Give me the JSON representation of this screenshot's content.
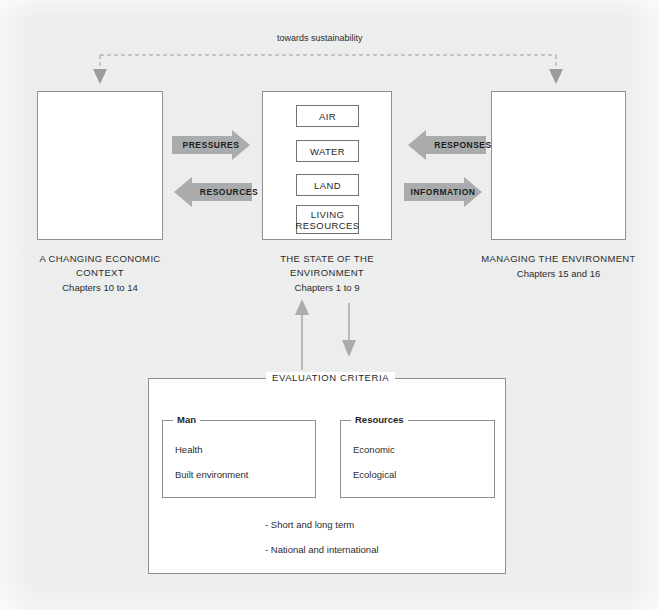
{
  "diagram": {
    "title": "towards sustainability",
    "background_color": "#eceded",
    "arrow_fill": "#a9abac",
    "box_border": "#8d8f90"
  },
  "top_link": {
    "label": "towards sustainability",
    "style": "dashed",
    "arrowheads": "both-ends-down"
  },
  "columns": [
    {
      "id": "economic-context",
      "items": [
        "Agriculture",
        "Industry",
        "Transport",
        "Energy",
        "Others"
      ],
      "caption_lines": [
        "A CHANGING ECONOMIC",
        "CONTEXT"
      ],
      "caption_sub": "Chapters 10 to 14"
    },
    {
      "id": "state-of-environment",
      "items": [
        "AIR",
        "WATER",
        "LAND",
        "LIVING RESOURCES"
      ],
      "caption_lines": [
        "THE STATE OF THE",
        "ENVIRONMENT"
      ],
      "caption_sub": "Chapters 1 to 9"
    },
    {
      "id": "managing-environment",
      "items": [
        "Economic Responses",
        "International Responses"
      ],
      "caption_lines": [
        "MANAGING THE ENVIRONMENT"
      ],
      "caption_sub": "Chapters 15 and 16"
    }
  ],
  "flow_arrows": [
    {
      "id": "pressures",
      "label": "PRESSURES",
      "direction": "right"
    },
    {
      "id": "resources",
      "label": "RESOURCES",
      "direction": "left"
    },
    {
      "id": "responses",
      "label": "RESPONSES",
      "direction": "left"
    },
    {
      "id": "information",
      "label": "INFORMATION",
      "direction": "right"
    }
  ],
  "vertical_arrows": [
    {
      "id": "criteria-to-state",
      "direction": "up"
    },
    {
      "id": "state-to-criteria",
      "direction": "down"
    }
  ],
  "evaluation": {
    "title": "EVALUATION CRITERIA",
    "groups": [
      {
        "id": "man",
        "title": "Man",
        "items": [
          "Health",
          "Built environment"
        ]
      },
      {
        "id": "resources",
        "title": "Resources",
        "items": [
          "Economic",
          "Ecological"
        ]
      }
    ],
    "notes": [
      "- Short and long term",
      "- National and international"
    ]
  }
}
